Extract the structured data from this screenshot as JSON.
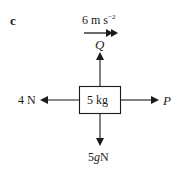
{
  "part_label": "c",
  "acceleration": {
    "value": "6 m s",
    "exponent": "−2"
  },
  "mass_label": "5 kg",
  "forces": {
    "up": "Q",
    "left": "4 N",
    "right": "P",
    "down_coeff": "5",
    "down_var": "g",
    "down_unit": "N"
  }
}
